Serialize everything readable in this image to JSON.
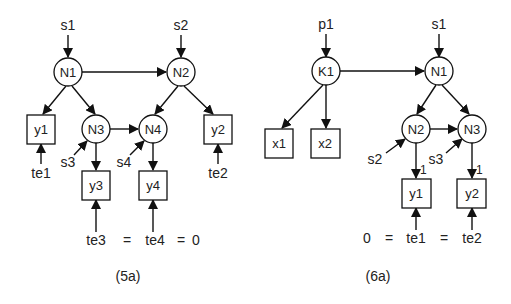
{
  "diagrams": [
    {
      "caption": "(5a)",
      "latent_nodes": [
        {
          "id": "N1",
          "label": "N1"
        },
        {
          "id": "N2",
          "label": "N2"
        },
        {
          "id": "N3",
          "label": "N3"
        },
        {
          "id": "N4",
          "label": "N4"
        }
      ],
      "observed_nodes": [
        {
          "id": "y1",
          "label": "y1"
        },
        {
          "id": "y2",
          "label": "y2"
        },
        {
          "id": "y3",
          "label": "y3"
        },
        {
          "id": "y4",
          "label": "y4"
        }
      ],
      "disturbances": [
        {
          "id": "s1",
          "label": "s1",
          "target": "N1"
        },
        {
          "id": "s2",
          "label": "s2",
          "target": "N2"
        },
        {
          "id": "s3",
          "label": "s3",
          "target": "N3"
        },
        {
          "id": "s4",
          "label": "s4",
          "target": "N4"
        }
      ],
      "errors": [
        {
          "id": "te1",
          "label": "te1",
          "target": "y1"
        },
        {
          "id": "te2",
          "label": "te2",
          "target": "y2"
        },
        {
          "id": "te3",
          "label": "te3",
          "target": "y3"
        },
        {
          "id": "te4",
          "label": "te4",
          "target": "y4"
        }
      ],
      "edges": [
        [
          "N1",
          "N2"
        ],
        [
          "N1",
          "y1"
        ],
        [
          "N1",
          "N3"
        ],
        [
          "N2",
          "N4"
        ],
        [
          "N2",
          "y2"
        ],
        [
          "N3",
          "N4"
        ],
        [
          "N3",
          "y3"
        ],
        [
          "N4",
          "y4"
        ]
      ],
      "constraint": {
        "parts": [
          "te3",
          "=",
          "te4",
          "=",
          "0"
        ]
      }
    },
    {
      "caption": "(6a)",
      "latent_nodes": [
        {
          "id": "K1",
          "label": "K1"
        },
        {
          "id": "N1",
          "label": "N1"
        },
        {
          "id": "N2",
          "label": "N2"
        },
        {
          "id": "N3",
          "label": "N3"
        }
      ],
      "observed_nodes": [
        {
          "id": "x1",
          "label": "x1"
        },
        {
          "id": "x2",
          "label": "x2"
        },
        {
          "id": "y1",
          "label": "y1"
        },
        {
          "id": "y2",
          "label": "y2"
        }
      ],
      "disturbances": [
        {
          "id": "p1",
          "label": "p1",
          "target": "K1"
        },
        {
          "id": "s1",
          "label": "s1",
          "target": "N1"
        },
        {
          "id": "s2",
          "label": "s2",
          "target": "N2"
        },
        {
          "id": "s3",
          "label": "s3",
          "target": "N3"
        }
      ],
      "errors": [
        {
          "id": "te1",
          "label": "te1",
          "target": "y1"
        },
        {
          "id": "te2",
          "label": "te2",
          "target": "y2"
        }
      ],
      "edges": [
        [
          "K1",
          "N1"
        ],
        [
          "K1",
          "x1"
        ],
        [
          "K1",
          "x2"
        ],
        [
          "N1",
          "N2"
        ],
        [
          "N1",
          "N3"
        ],
        [
          "N2",
          "N3"
        ],
        [
          "N2",
          "y1"
        ],
        [
          "N3",
          "y2"
        ]
      ],
      "loadings": {
        "N2_y1": "1",
        "N3_y2": "1"
      },
      "constraint": {
        "parts": [
          "0",
          "=",
          "te1",
          "=",
          "te2"
        ]
      }
    }
  ]
}
